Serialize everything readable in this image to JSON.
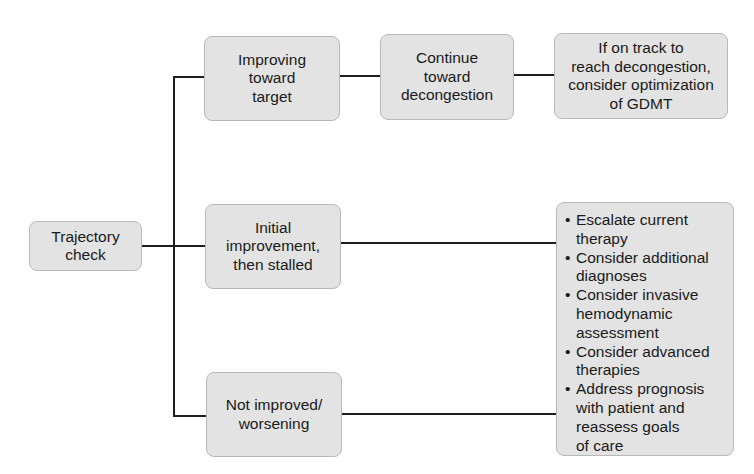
{
  "diagram": {
    "type": "flowchart",
    "root": {
      "label": "Trajectory check"
    },
    "branches": [
      {
        "label": "Improving toward target",
        "next": {
          "label": "Continue toward decongestion"
        },
        "outcome": {
          "label": "If on track to reach decongestion, consider optimization of GDMT"
        }
      },
      {
        "label": "Initial improvement, then stalled",
        "outcome_ref": "shared_actions"
      },
      {
        "label": "Not improved/ worsening",
        "outcome_ref": "shared_actions"
      }
    ],
    "shared_actions": {
      "items": [
        "Escalate current therapy",
        "Consider additional diagnoses",
        "Consider invasive hemodynamic assessment",
        "Consider advanced therapies",
        "Address prognosis with patient and reassess goals of care"
      ]
    }
  },
  "display": {
    "root_lines": [
      "Trajectory",
      "check"
    ],
    "improving_lines": [
      "Improving",
      "toward",
      "target"
    ],
    "continue_lines": [
      "Continue",
      "toward",
      "decongestion"
    ],
    "ontrack_lines": [
      "If on track to",
      "reach decongestion,",
      "consider optimization",
      "of GDMT"
    ],
    "stalled_lines": [
      "Initial",
      "improvement,",
      "then stalled"
    ],
    "worsening_lines": [
      "Not improved/",
      "worsening"
    ],
    "bullet_char": "•",
    "bullets": [
      [
        "Escalate current",
        "therapy"
      ],
      [
        "Consider additional",
        "diagnoses"
      ],
      [
        "Consider invasive",
        "hemodynamic",
        "assessment"
      ],
      [
        "Consider advanced",
        "therapies"
      ],
      [
        "Address prognosis",
        "with patient and",
        "reassess goals",
        "of care"
      ]
    ]
  },
  "colors": {
    "box_fill": "#e3e3e3",
    "box_border": "#b9b9b9",
    "connector": "#1e1e1e",
    "text": "#1a1a1a"
  }
}
